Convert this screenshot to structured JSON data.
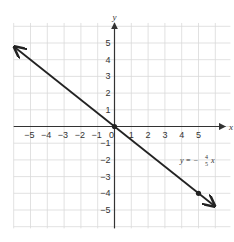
{
  "chart_data": {
    "type": "line",
    "title": "",
    "xlabel": "x",
    "ylabel": "y",
    "xlim": [
      -6,
      6
    ],
    "ylim": [
      -6,
      6
    ],
    "grid": true,
    "x_ticks": [
      -5,
      -4,
      -3,
      -2,
      -1,
      0,
      1,
      2,
      3,
      4,
      5
    ],
    "y_ticks": [
      -5,
      -4,
      -3,
      -2,
      -1,
      1,
      2,
      3,
      4,
      5
    ],
    "x_tick_labels": [
      "−5",
      "−4",
      "−3",
      "−2",
      "−1",
      "0",
      "1",
      "2",
      "3",
      "4",
      "5"
    ],
    "y_tick_labels": [
      "−5",
      "−4",
      "−3",
      "−2",
      "−1",
      "1",
      "2",
      "3",
      "4",
      "5"
    ],
    "series": [
      {
        "name": "y = −4/5 x",
        "equation": "y = -(4/5)x",
        "slope": -0.8,
        "intercept": 0,
        "x": [
          -6,
          0,
          5,
          6
        ],
        "y": [
          4.8,
          0,
          -4,
          -4.8
        ],
        "marked_points": [
          [
            0,
            0
          ],
          [
            5,
            -4
          ]
        ],
        "arrows_both_ends": true
      }
    ],
    "annotations": [
      {
        "text_prefix": "y = −",
        "fraction_num": "4",
        "fraction_den": "5",
        "text_suffix": "x",
        "anchor": [
          4,
          -2
        ]
      }
    ],
    "colors": {
      "line": "#222222",
      "grid": "#d9d9d9",
      "axis": "#333333",
      "text": "#333333"
    }
  },
  "labels": {
    "x_axis": "x",
    "y_axis": "y",
    "origin": "0",
    "equation_prefix": "y = −",
    "equation_num": "4",
    "equation_den": "5",
    "equation_var": "x"
  }
}
